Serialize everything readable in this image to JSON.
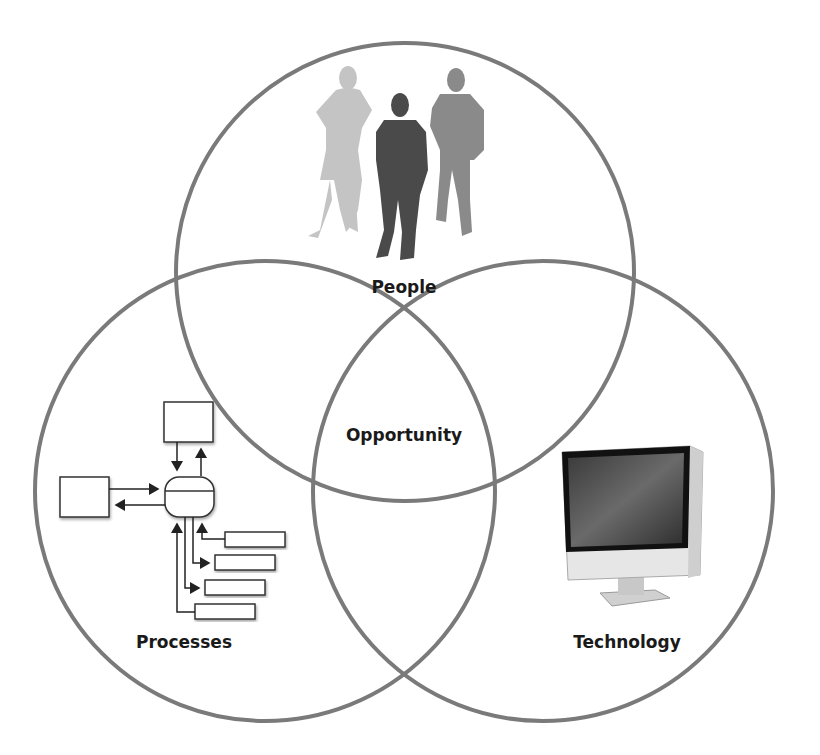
{
  "diagram": {
    "type": "venn",
    "circles": [
      {
        "id": "people",
        "label": "People",
        "cx": 405,
        "cy": 272,
        "r": 229,
        "icon": "business-people-silhouettes-icon"
      },
      {
        "id": "processes",
        "label": "Processes",
        "cx": 265,
        "cy": 491,
        "r": 230,
        "icon": "process-flow-diagram-icon"
      },
      {
        "id": "technology",
        "label": "Technology",
        "cx": 543,
        "cy": 491,
        "r": 230,
        "icon": "desktop-computer-icon"
      }
    ],
    "intersection": {
      "label": "Opportunity"
    },
    "stroke_color": "#7a7a7a"
  }
}
